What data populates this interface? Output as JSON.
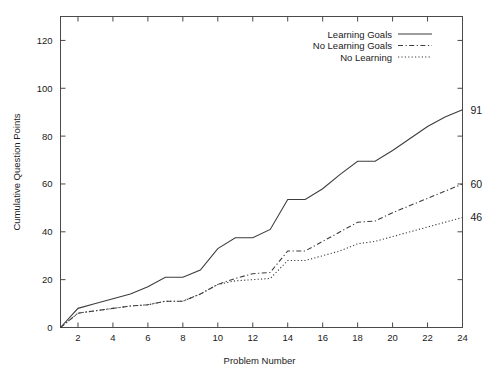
{
  "chart_data": {
    "type": "line",
    "title": "",
    "xlabel": "Problem      Number",
    "ylabel": "Cumulative Question Points",
    "xlim": [
      1,
      24
    ],
    "ylim": [
      0,
      130
    ],
    "grid": false,
    "legend_position": "top-right",
    "x": [
      1,
      2,
      3,
      4,
      5,
      6,
      7,
      8,
      9,
      10,
      11,
      12,
      13,
      14,
      15,
      16,
      17,
      18,
      19,
      20,
      21,
      22,
      23,
      24
    ],
    "xticks": [
      2,
      4,
      6,
      8,
      10,
      12,
      14,
      16,
      18,
      20,
      22,
      24
    ],
    "xtick_labels": [
      "2",
      "4",
      "6",
      "8",
      "10",
      "12",
      "14",
      "16",
      "18",
      "20",
      "22",
      "24"
    ],
    "yticks": [
      0,
      20,
      40,
      60,
      80,
      100,
      120
    ],
    "ytick_labels": [
      "0",
      "20",
      "40",
      "60",
      "80",
      "100",
      "120"
    ],
    "series": [
      {
        "name": "Learning Goals",
        "style": "solid",
        "end_label": "91",
        "values": [
          0,
          8,
          10,
          12,
          14,
          17,
          21,
          21,
          24,
          33,
          37.5,
          37.5,
          41,
          53.5,
          53.5,
          58,
          64,
          69.5,
          69.5,
          74,
          79,
          84,
          88,
          91
        ]
      },
      {
        "name": "No Learning Goals",
        "style": "dashed",
        "end_label": "60",
        "values": [
          0,
          6,
          7,
          8,
          9,
          9.5,
          11,
          11,
          14,
          18,
          20.5,
          22.5,
          23,
          32,
          32,
          36,
          40,
          44,
          44.5,
          48,
          51,
          54,
          57,
          60
        ]
      },
      {
        "name": "No Learning",
        "style": "dotted",
        "end_label": "46",
        "values": [
          0,
          6,
          7,
          8,
          9,
          9.5,
          11,
          11,
          14,
          18,
          19.5,
          20,
          20.5,
          28,
          28,
          30,
          32,
          35,
          36,
          38,
          40,
          42,
          44,
          46
        ]
      }
    ]
  },
  "colors": {
    "line": "#3d3d3d",
    "axis": "#4a4a4a",
    "text": "#1a1a1a",
    "background": "#ffffff"
  }
}
